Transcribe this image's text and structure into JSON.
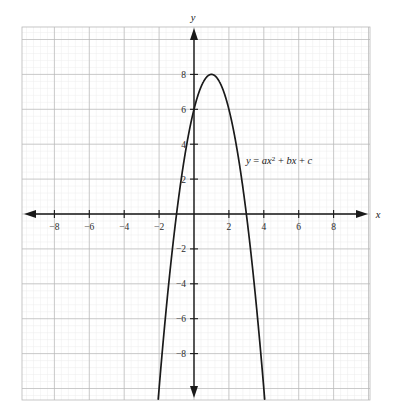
{
  "figure": {
    "name": "quadratic-parabola-graph",
    "background_color": "#ffffff"
  },
  "annotation": {
    "equation_parts": {
      "y": "y",
      "equals": " = ",
      "a": "a",
      "x": "x",
      "exponent": "2",
      "plus_one": " + ",
      "b": "b",
      "x2": "x",
      "plus_two": " + ",
      "c": "c"
    },
    "equation_plain": "y = ax² + bx + c"
  },
  "axes": {
    "x_name": "x",
    "y_name": "y",
    "x_tick_labels": [
      "−8",
      "−6",
      "−4",
      "−2",
      "2",
      "4",
      "6",
      "8"
    ],
    "x_tick_values": [
      -8,
      -6,
      -4,
      -2,
      2,
      4,
      6,
      8
    ],
    "y_tick_labels": [
      "8",
      "6",
      "4",
      "2",
      "−2",
      "−4",
      "−6",
      "−8"
    ],
    "y_tick_values": [
      8,
      6,
      4,
      2,
      -2,
      -4,
      -6,
      -8
    ],
    "axis_color": "#1a1a1a",
    "grid_major_color": "#b8b8b8",
    "grid_minor_color": "#ececec"
  },
  "chart_data": {
    "type": "line",
    "title": "",
    "subtitle": "",
    "xlabel": "x",
    "ylabel": "y",
    "xlim": [
      -9.2,
      9.2
    ],
    "ylim": [
      -10.2,
      9.2
    ],
    "grid": true,
    "grid_major_step": 2,
    "grid_minor_step": 0.4,
    "legend": null,
    "annotations": [
      {
        "text": "y = ax² + bx + c",
        "x": 3.1,
        "y": 3.0
      }
    ],
    "series": [
      {
        "name": "parabola",
        "equation": "y = -2x^2 + 4x + 6",
        "coefficients": {
          "a": -2,
          "b": 4,
          "c": 6
        },
        "vertex": [
          1,
          8
        ],
        "roots": [
          -1,
          3
        ],
        "y_intercept": 6,
        "opens": "down",
        "color": "#1a1a1a",
        "x": [
          -1.95,
          -1.8,
          -1.6,
          -1.4,
          -1.2,
          -1,
          -0.8,
          -0.6,
          -0.4,
          -0.2,
          0,
          0.2,
          0.4,
          0.6,
          0.8,
          1,
          1.2,
          1.4,
          1.6,
          1.8,
          2,
          2.2,
          2.4,
          2.6,
          2.8,
          3,
          3.2,
          3.4,
          3.6,
          3.8,
          3.95
        ],
        "values": [
          -9.41,
          -7.68,
          -5.32,
          -3.12,
          -1.68,
          0,
          1.52,
          2.88,
          4.08,
          5.12,
          6,
          6.72,
          7.28,
          7.68,
          7.92,
          8,
          7.92,
          7.68,
          7.28,
          6.72,
          6,
          5.12,
          4.08,
          2.88,
          1.52,
          0,
          -1.68,
          -3.12,
          -5.32,
          -7.68,
          -9.41
        ]
      }
    ]
  }
}
